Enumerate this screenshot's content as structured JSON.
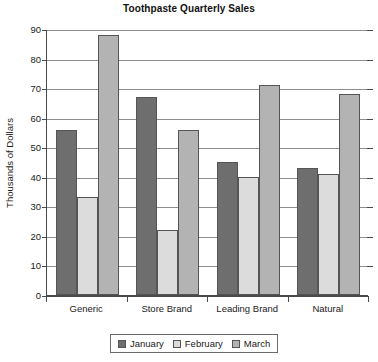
{
  "chart_data": {
    "type": "bar",
    "title": "Toothpaste Quarterly Sales",
    "xlabel": "",
    "ylabel": "Thousands of Dollars",
    "categories": [
      "Generic",
      "Store Brand",
      "Leading Brand",
      "Natural"
    ],
    "series": [
      {
        "name": "January",
        "color": "#6e6e6e",
        "values": [
          56,
          67,
          45,
          43
        ]
      },
      {
        "name": "February",
        "color": "#dcdcdc",
        "values": [
          33,
          22,
          40,
          41
        ]
      },
      {
        "name": "March",
        "color": "#b3b3b3",
        "values": [
          88,
          56,
          71,
          68
        ]
      }
    ],
    "ylim": [
      0,
      90
    ],
    "ytick_values": [
      0,
      10,
      20,
      30,
      40,
      50,
      60,
      70,
      80,
      90
    ],
    "ytick_labels": [
      "0",
      "10",
      "20",
      "30",
      "40",
      "50",
      "60",
      "70",
      "80",
      "90"
    ],
    "grid": true,
    "legend_position": "bottom-center",
    "legend_entries": [
      "January",
      "February",
      "March"
    ]
  }
}
